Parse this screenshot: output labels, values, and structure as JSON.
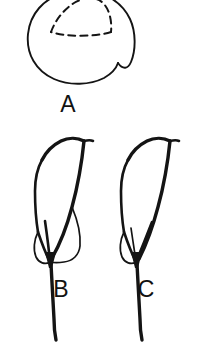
{
  "figure": {
    "background_color": "#ffffff",
    "ink_color": "#141414",
    "width": 210,
    "height": 343,
    "style": "black-and-white scientific line drawing",
    "panels": [
      {
        "id": "a",
        "label": "A",
        "label_x": 68,
        "label_y": 112,
        "description": "rounded outline with dashed triangular inner boundary, clipped at top edge"
      },
      {
        "id": "b",
        "label": "B",
        "label_x": 61,
        "label_y": 297,
        "description": "hooked structure with two basal lobes and long tapering stalk"
      },
      {
        "id": "c",
        "label": "C",
        "label_x": 146,
        "label_y": 297,
        "description": "hooked structure with single narrow basal lobe and long tapering stalk"
      }
    ],
    "shapes": {
      "a_outline": "M 63 -6 C 44 -2 30 14 28 34 C 26 54 36 71 54 79 C 70 86 90 85 104 78 C 112 74 117 68 118 63 C 122 69 127 70 130 64 C 136 52 136 33 130 19 C 122 2 104 -8 85 -9 C 77 -9 70 -8 63 -6 Z",
      "a_dashed": "M 52 33 C 57 20 66 9 78 3 C 90 -3 102 -1 108 8 C 113 16 112 26 110 33 C 96 38 66 38 52 33 Z",
      "b_spine_outer": "M 36 177 C 34 160 42 147 54 140 C 62 136 70 135 76 137 C 80 138 82 140 82 142",
      "b_top_edge": "M 82 142 C 76 139 68 138 61 141 C 54 144 48 150 44 158",
      "b_left_body": "M 36 177 C 35 194 36 213 39 231 C 41 243 43 252 46 259",
      "b_right_body": "M 82 142 C 80 162 76 186 70 209 C 64 232 57 250 50 262",
      "b_lobe_left": "M 39 231 C 35 238 33 248 36 256 C 39 263 45 266 49 263",
      "b_lobe_right": "M 70 209 C 74 219 78 233 78 245 C 78 254 74 260 66 262 C 59 263 53 263 49 263",
      "b_stem": "M 49 263 C 50 280 51 302 52 318 C 52 328 53 334 54 339",
      "c_spine_outer": "M 122 177 C 120 160 128 147 140 140 C 148 136 156 135 162 137 C 166 138 168 140 168 142",
      "c_top_edge": "M 168 142 C 162 139 154 138 147 141 C 140 144 134 150 130 158",
      "c_left_body": "M 122 177 C 121 194 122 213 125 231 C 127 243 129 252 132 259",
      "c_right_body": "M 168 142 C 166 162 162 186 156 209 C 150 232 143 250 136 262",
      "c_lobe_left": "M 125 231 C 121 238 119 248 122 256 C 125 263 131 266 135 263",
      "c_lobe_inner": "M 150 222 C 146 234 140 248 135 256 C 132 261 130 263 135 263",
      "c_stem": "M 135 263 C 136 280 137 302 138 318 C 138 328 139 334 140 339"
    }
  }
}
